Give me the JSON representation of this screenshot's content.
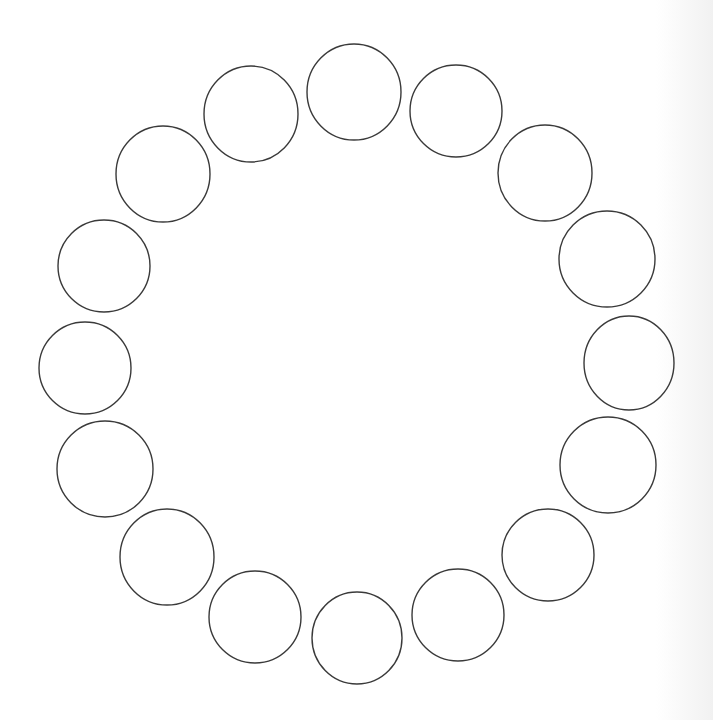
{
  "diagram": {
    "type": "circle-ring",
    "stroke_color": "#3a3a3a",
    "background_color": "#ffffff",
    "circles": [
      {
        "cx": 354,
        "cy": 92,
        "rx": 47,
        "ry": 48
      },
      {
        "cx": 456,
        "cy": 111,
        "rx": 46,
        "ry": 46
      },
      {
        "cx": 545,
        "cy": 173,
        "rx": 47,
        "ry": 48
      },
      {
        "cx": 607,
        "cy": 259,
        "rx": 48,
        "ry": 48
      },
      {
        "cx": 629,
        "cy": 363,
        "rx": 45,
        "ry": 47
      },
      {
        "cx": 608,
        "cy": 465,
        "rx": 48,
        "ry": 48
      },
      {
        "cx": 548,
        "cy": 555,
        "rx": 46,
        "ry": 46
      },
      {
        "cx": 458,
        "cy": 615,
        "rx": 46,
        "ry": 46
      },
      {
        "cx": 357,
        "cy": 638,
        "rx": 45,
        "ry": 46
      },
      {
        "cx": 255,
        "cy": 617,
        "rx": 46,
        "ry": 46
      },
      {
        "cx": 167,
        "cy": 557,
        "rx": 47,
        "ry": 48
      },
      {
        "cx": 105,
        "cy": 469,
        "rx": 48,
        "ry": 48
      },
      {
        "cx": 85,
        "cy": 368,
        "rx": 46,
        "ry": 46
      },
      {
        "cx": 104,
        "cy": 266,
        "rx": 46,
        "ry": 46
      },
      {
        "cx": 163,
        "cy": 174,
        "rx": 47,
        "ry": 48
      },
      {
        "cx": 251,
        "cy": 114,
        "rx": 47,
        "ry": 48
      }
    ]
  }
}
